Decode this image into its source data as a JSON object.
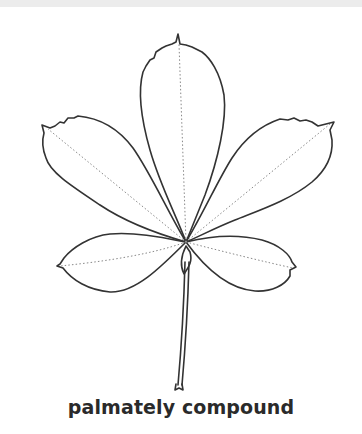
{
  "figure": {
    "leaflet_count": 5,
    "line_color": "#333333",
    "vein_color": "#888888",
    "background": "#ffffff",
    "top_band_color": "#ececec"
  },
  "caption": {
    "text": "palmately compound"
  }
}
